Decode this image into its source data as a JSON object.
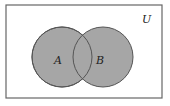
{
  "diagram": {
    "type": "venn",
    "universe_label": "U",
    "sets": [
      {
        "label": "A",
        "cx": 62,
        "cy": 57,
        "r": 30
      },
      {
        "label": "B",
        "cx": 103,
        "cy": 57,
        "r": 30
      }
    ],
    "colors": {
      "fill": "#a6a6a6",
      "stroke": "#555555",
      "border": "#666666"
    }
  }
}
